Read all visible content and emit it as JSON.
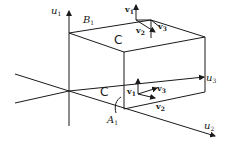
{
  "diagram": {
    "axes": {
      "u1": {
        "base": "u",
        "sub": "1"
      },
      "u2": {
        "base": "u",
        "sub": "2"
      },
      "u3": {
        "base": "u",
        "sub": "3"
      }
    },
    "regions": {
      "B1": {
        "base": "B",
        "sub": "1"
      },
      "A1": {
        "base": "A",
        "sub": "1"
      }
    },
    "top_frame": {
      "v1": {
        "base": "v",
        "sub": "1"
      },
      "v2": {
        "base": "v",
        "sub": "2"
      },
      "v3": {
        "base": "v",
        "sub": "3"
      }
    },
    "bottom_frame": {
      "v1": {
        "base": "v",
        "sub": "1"
      },
      "v2": {
        "base": "v",
        "sub": "2"
      },
      "v3": {
        "base": "v",
        "sub": "3"
      }
    },
    "orientation_symbol": "C",
    "colors": {
      "line": "#1a1a1a",
      "background": "#ffffff"
    }
  }
}
